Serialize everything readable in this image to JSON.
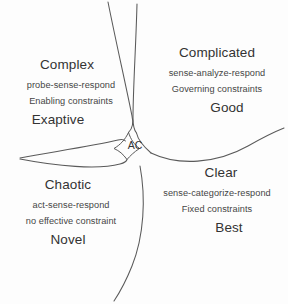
{
  "diagram": {
    "background_color": "#fdfdfd",
    "line_color": "#5a5a5a",
    "text_color": "#3a3a3a",
    "center": {
      "label": "AC"
    },
    "domains": [
      {
        "id": "complex",
        "title": "Complex",
        "approach": "probe-sense-respond",
        "constraints": "Enabling constraints",
        "quality": "Exaptive"
      },
      {
        "id": "complicated",
        "title": "Complicated",
        "approach": "sense-analyze-respond",
        "constraints": "Governing constraints",
        "quality": "Good"
      },
      {
        "id": "chaotic",
        "title": "Chaotic",
        "approach": "act-sense-respond",
        "constraints": "no effective constraint",
        "quality": "Novel"
      },
      {
        "id": "clear",
        "title": "Clear",
        "approach": "sense-categorize-respond",
        "constraints": "Fixed constraints",
        "quality": "Best"
      }
    ]
  }
}
